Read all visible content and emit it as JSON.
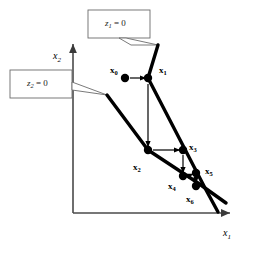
{
  "figure": {
    "background_color": "#ffffff",
    "ink_color": "#000000",
    "callout_border_color": "#595959"
  },
  "axes": {
    "x_axis_label": "x",
    "x_axis_subscript": "1",
    "y_axis_label": "x",
    "y_axis_subscript": "2",
    "origin_px": [
      73,
      213
    ],
    "x_axis_end_px": [
      237,
      213
    ],
    "y_axis_end_px": [
      73,
      37
    ]
  },
  "callouts": [
    {
      "id": "callout-z1",
      "var": "z",
      "subscript": "1",
      "equals": " = 0",
      "box_px": [
        88,
        10,
        62,
        28
      ],
      "pointer_to_px": [
        158,
        45
      ]
    },
    {
      "id": "callout-z2",
      "var": "z",
      "subscript": "2",
      "equals": " = 0",
      "box_px": [
        10,
        70,
        62,
        28
      ],
      "pointer_to_px": [
        107,
        95
      ]
    }
  ],
  "constraint_lines": [
    {
      "name": "z1-line",
      "label": "z1 = 0",
      "vertices_px": [
        [
          158,
          45
        ],
        [
          148,
          78
        ],
        [
          205,
          188
        ],
        [
          218,
          212
        ]
      ]
    },
    {
      "name": "z2-line",
      "label": "z2 = 0",
      "vertices_px": [
        [
          107,
          95
        ],
        [
          148,
          150
        ],
        [
          198,
          183
        ],
        [
          226,
          203
        ]
      ]
    }
  ],
  "points": [
    {
      "name": "x0",
      "label": "x",
      "subscript": "0",
      "cx": 125,
      "cy": 78,
      "r": 4.2,
      "label_px": [
        110,
        66
      ]
    },
    {
      "name": "x1",
      "label": "x",
      "subscript": "1",
      "cx": 148,
      "cy": 78,
      "r": 4.2,
      "label_px": [
        159,
        66
      ]
    },
    {
      "name": "x2",
      "label": "x",
      "subscript": "2",
      "cx": 148,
      "cy": 150,
      "r": 4.2,
      "label_px": [
        133,
        163
      ]
    },
    {
      "name": "x3",
      "label": "x",
      "subscript": "3",
      "cx": 183,
      "cy": 150,
      "r": 4.2,
      "label_px": [
        189,
        146
      ]
    },
    {
      "name": "x4",
      "label": "x",
      "subscript": "4",
      "cx": 183,
      "cy": 176,
      "r": 4.2,
      "label_px": [
        168,
        182
      ]
    },
    {
      "name": "x5",
      "label": "x",
      "subscript": "5",
      "cx": 196,
      "cy": 173,
      "r": 4.2,
      "label_px": [
        205,
        170
      ]
    },
    {
      "name": "x6",
      "label": "x",
      "subscript": "6",
      "cx": 196,
      "cy": 186,
      "r": 4.2,
      "label_px": [
        186,
        196
      ]
    }
  ],
  "iteration_arrows": [
    {
      "name": "arrow-x0-x1",
      "from_px": [
        130,
        78
      ],
      "to_px": [
        146,
        78
      ],
      "direction": "right"
    },
    {
      "name": "arrow-x1-x2",
      "from_px": [
        148,
        83
      ],
      "to_px": [
        148,
        148
      ],
      "direction": "down"
    },
    {
      "name": "arrow-x2-x3",
      "from_px": [
        153,
        150
      ],
      "to_px": [
        181,
        150
      ],
      "direction": "right"
    },
    {
      "name": "arrow-x3-x4",
      "from_px": [
        183,
        155
      ],
      "to_px": [
        183,
        174
      ],
      "direction": "down"
    },
    {
      "name": "arrow-x4-x5",
      "from_px": [
        188,
        176
      ],
      "to_px": [
        194,
        174
      ],
      "direction": "right"
    },
    {
      "name": "arrow-x5-x6",
      "from_px": [
        196,
        178
      ],
      "to_px": [
        196,
        184
      ],
      "direction": "down"
    }
  ]
}
